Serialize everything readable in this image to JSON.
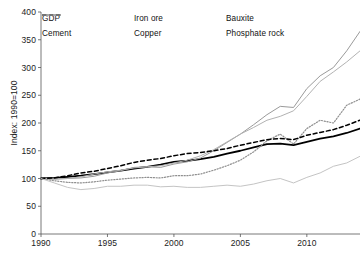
{
  "chart_data": {
    "type": "line",
    "title": "",
    "xlabel": "",
    "ylabel": "Index: 1990=100",
    "xlim": [
      1990,
      2014
    ],
    "ylim": [
      0,
      400
    ],
    "yticks": [
      0,
      50,
      100,
      150,
      200,
      250,
      300,
      350,
      400
    ],
    "xticks": [
      1990,
      1995,
      2000,
      2005,
      2010
    ],
    "grid": false,
    "legend_position": "top-left",
    "x": [
      1990,
      1991,
      1992,
      1993,
      1994,
      1995,
      1996,
      1997,
      1998,
      1999,
      2000,
      2001,
      2002,
      2003,
      2004,
      2005,
      2006,
      2007,
      2008,
      2009,
      2010,
      2011,
      2012,
      2013,
      2014
    ],
    "series": [
      {
        "name": "GDP",
        "style": "solid",
        "color": "#000000",
        "width": 1.8,
        "values": [
          100,
          101,
          103,
          105,
          108,
          111,
          114,
          118,
          121,
          125,
          130,
          132,
          135,
          139,
          145,
          150,
          156,
          162,
          163,
          160,
          166,
          172,
          176,
          182,
          190
        ]
      },
      {
        "name": "Iron ore",
        "style": "solid",
        "color": "#9a9a9a",
        "width": 1.0,
        "values": [
          100,
          99,
          100,
          101,
          104,
          110,
          114,
          120,
          121,
          120,
          126,
          130,
          137,
          150,
          165,
          180,
          197,
          215,
          230,
          228,
          262,
          285,
          300,
          330,
          365
        ]
      },
      {
        "name": "Bauxite",
        "style": "dotted",
        "color": "#8f8f8f",
        "width": 1.2,
        "values": [
          100,
          96,
          93,
          92,
          94,
          97,
          99,
          101,
          102,
          101,
          105,
          105,
          108,
          115,
          123,
          133,
          148,
          168,
          180,
          162,
          190,
          205,
          200,
          232,
          243
        ]
      },
      {
        "name": "Cement",
        "style": "solid",
        "color": "#b2b2b2",
        "width": 1.0,
        "values": [
          100,
          99,
          100,
          103,
          108,
          112,
          115,
          119,
          121,
          123,
          128,
          133,
          141,
          152,
          166,
          180,
          192,
          205,
          212,
          222,
          248,
          275,
          292,
          310,
          330
        ]
      },
      {
        "name": "Copper",
        "style": "dashed",
        "color": "#000000",
        "width": 1.5,
        "values": [
          100,
          101,
          105,
          110,
          113,
          118,
          123,
          129,
          133,
          136,
          141,
          145,
          147,
          150,
          154,
          160,
          165,
          170,
          172,
          170,
          178,
          183,
          188,
          196,
          205
        ]
      },
      {
        "name": "Phosphate rock",
        "style": "solid",
        "color": "#c4c4c4",
        "width": 1.0,
        "values": [
          100,
          92,
          84,
          80,
          82,
          86,
          86,
          88,
          88,
          85,
          86,
          84,
          84,
          86,
          88,
          86,
          90,
          96,
          100,
          92,
          102,
          110,
          122,
          128,
          140
        ]
      }
    ]
  },
  "axes": {
    "ylabel": "Index: 1990=100",
    "ytick_labels": [
      "0",
      "50",
      "100",
      "150",
      "200",
      "250",
      "300",
      "350",
      "400"
    ],
    "xtick_labels": [
      "1990",
      "1995",
      "2000",
      "2005",
      "2010"
    ]
  },
  "legend": {
    "entries": [
      {
        "label": "GDP"
      },
      {
        "label": "Iron ore"
      },
      {
        "label": "Bauxite"
      },
      {
        "label": "Cement"
      },
      {
        "label": "Copper"
      },
      {
        "label": "Phosphate rock"
      }
    ]
  }
}
